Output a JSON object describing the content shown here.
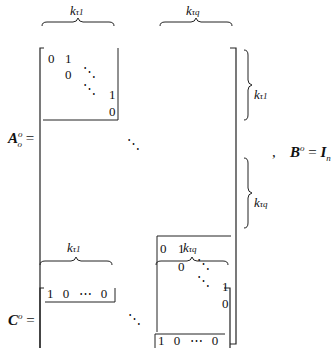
{
  "formula": {
    "A": {
      "label": "A",
      "sup": "o",
      "sub": "o",
      "eq": "=",
      "brace_top_1": {
        "k": "k",
        "sub": "τ1"
      },
      "brace_top_2": {
        "k": "k",
        "sub": "τq"
      },
      "brace_right_1": {
        "k": "k",
        "sub": "τ1"
      },
      "brace_right_2": {
        "k": "k",
        "sub": "τq"
      },
      "block": {
        "r1": [
          "0",
          "1"
        ],
        "r2": [
          "0"
        ],
        "r3": [
          "1"
        ],
        "r4": [
          "0"
        ]
      }
    },
    "separator": ",",
    "B": {
      "label": "B",
      "sup": "o",
      "sub": "o",
      "eq": "=",
      "rhs": "I",
      "rhs_sub": "n",
      "rhs_subsub": "1"
    },
    "C": {
      "label": "C",
      "sup": "o",
      "sub": "o",
      "eq": "=",
      "brace_top_1": {
        "k": "k",
        "sub": "τ1"
      },
      "brace_top_2": {
        "k": "k",
        "sub": "τq"
      },
      "row": [
        "1",
        "0",
        "⋯",
        "0"
      ]
    }
  }
}
